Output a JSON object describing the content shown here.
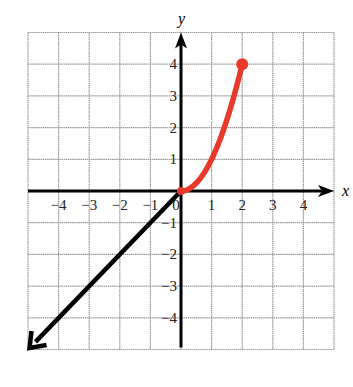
{
  "chart_data": {
    "type": "line",
    "title": "",
    "xlabel": "x",
    "ylabel": "y",
    "xlim": [
      -5,
      5
    ],
    "ylim": [
      -5,
      5
    ],
    "grid": true,
    "x_ticks": [
      "-4",
      "-3",
      "-2",
      "-1",
      "0",
      "1",
      "2",
      "3",
      "4"
    ],
    "y_ticks": [
      "4",
      "3",
      "2",
      "1",
      "-1",
      "-2",
      "-3",
      "-4"
    ],
    "series": [
      {
        "name": "y = x (x < 0)",
        "color": "#000000",
        "description": "Line y = x for x <= 0, with arrow continuing toward bottom-left",
        "points": [
          [
            0,
            0
          ],
          [
            -5,
            -5
          ]
        ],
        "endpoint_start": "none",
        "endpoint_end": "arrow"
      },
      {
        "name": "y = x^2 (0 <= x <= 2)",
        "color": "#e8392a",
        "description": "Parabola segment from origin to closed dot at (2, 4)",
        "points": [
          [
            0,
            0
          ],
          [
            0.5,
            0.25
          ],
          [
            1,
            1
          ],
          [
            1.5,
            2.25
          ],
          [
            2,
            4
          ]
        ],
        "endpoint_start": "none",
        "endpoint_end": "closed-dot"
      }
    ]
  },
  "colors": {
    "grid": "#9a9a9a",
    "axis": "#000000",
    "curve": "#e8392a",
    "line": "#000000"
  }
}
